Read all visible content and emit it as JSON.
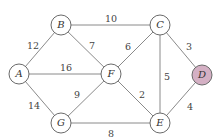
{
  "graph": {
    "nodes": [
      {
        "id": "A",
        "label": "A",
        "x": 19,
        "y": 74,
        "fill": "#ffffff"
      },
      {
        "id": "B",
        "label": "B",
        "x": 61,
        "y": 25,
        "fill": "#ffffff"
      },
      {
        "id": "C",
        "label": "C",
        "x": 160,
        "y": 25,
        "fill": "#ffffff"
      },
      {
        "id": "D",
        "label": "D",
        "x": 202,
        "y": 75,
        "fill": "#d4b0c4"
      },
      {
        "id": "E",
        "label": "E",
        "x": 160,
        "y": 123,
        "fill": "#ffffff"
      },
      {
        "id": "F",
        "label": "F",
        "x": 111,
        "y": 74,
        "fill": "#ffffff"
      },
      {
        "id": "G",
        "label": "G",
        "x": 61,
        "y": 123,
        "fill": "#ffffff"
      }
    ],
    "edges": [
      {
        "from": "A",
        "to": "B",
        "weight": "12",
        "lx": 33,
        "ly": 46
      },
      {
        "from": "B",
        "to": "C",
        "weight": "10",
        "lx": 111,
        "ly": 19
      },
      {
        "from": "B",
        "to": "F",
        "weight": "7",
        "lx": 92,
        "ly": 46
      },
      {
        "from": "A",
        "to": "F",
        "weight": "16",
        "lx": 66,
        "ly": 68
      },
      {
        "from": "A",
        "to": "G",
        "weight": "14",
        "lx": 34,
        "ly": 106
      },
      {
        "from": "F",
        "to": "G",
        "weight": "9",
        "lx": 77,
        "ly": 95
      },
      {
        "from": "C",
        "to": "F",
        "weight": "6",
        "lx": 128,
        "ly": 47
      },
      {
        "from": "C",
        "to": "E",
        "weight": "5",
        "lx": 167,
        "ly": 77
      },
      {
        "from": "C",
        "to": "D",
        "weight": "3",
        "lx": 189,
        "ly": 47
      },
      {
        "from": "F",
        "to": "E",
        "weight": "2",
        "lx": 142,
        "ly": 95
      },
      {
        "from": "D",
        "to": "E",
        "weight": "4",
        "lx": 190,
        "ly": 107
      },
      {
        "from": "G",
        "to": "E",
        "weight": "8",
        "lx": 111,
        "ly": 134
      }
    ],
    "node_radius": 10,
    "highlight_color": "#d4b0c4"
  }
}
